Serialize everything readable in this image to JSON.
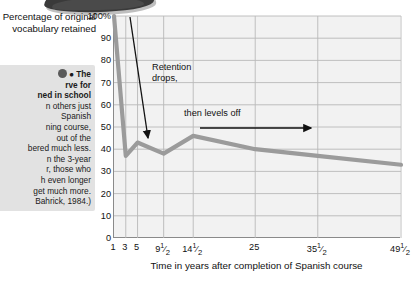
{
  "figure": {
    "y_axis_title": "Percentage of original vocabulary retained",
    "x_axis_title": "Time in years after completion of Spanish course"
  },
  "caption": {
    "marker_icon": "figure-number-circle",
    "lines": [
      "● The",
      "rve for",
      "ned in school",
      "n others just",
      "Spanish",
      "ning course,",
      " out of the",
      "bered much less.",
      "n the 3-year",
      "r, those who",
      "h even longer",
      "get much more.",
      "Bahrick, 1984.)"
    ],
    "bold_lines": [
      0,
      1,
      2
    ]
  },
  "annotations": [
    {
      "name": "retention-drops",
      "text_line1": "Retention",
      "text_line2": "drops,",
      "x": 26,
      "y": 52
    },
    {
      "name": "then-levels-off",
      "text": "then levels off",
      "x": 72,
      "y": 96
    }
  ],
  "chart_data": {
    "type": "line",
    "title": "",
    "xlabel": "Time in years after completion of Spanish course",
    "ylabel": "Percentage of original vocabulary retained",
    "ylim": [
      0,
      100
    ],
    "ytick_labels": [
      "100%",
      "90",
      "80",
      "70",
      "60",
      "50",
      "40",
      "30",
      "20",
      "10",
      "0"
    ],
    "ytick_values": [
      100,
      90,
      80,
      70,
      60,
      50,
      40,
      30,
      20,
      10,
      0
    ],
    "xtick_labels": [
      "1",
      "3",
      "5",
      "9½",
      "14½",
      "25",
      "35½",
      "49½"
    ],
    "x_positions_pct": [
      0.0,
      4.1,
      8.2,
      17.3,
      27.6,
      49.2,
      71.0,
      100.0
    ],
    "x": [
      1,
      3,
      5,
      9.5,
      14.5,
      25,
      35.5,
      49.5
    ],
    "values": [
      100,
      37,
      43,
      38,
      46,
      40,
      37,
      33
    ],
    "grid": true,
    "legend": "none",
    "line_color": "#9b9b9b",
    "plot_background": "#f2f2f2",
    "grid_color": "#b9b9b9",
    "axis_color": "#8a8a8a"
  }
}
